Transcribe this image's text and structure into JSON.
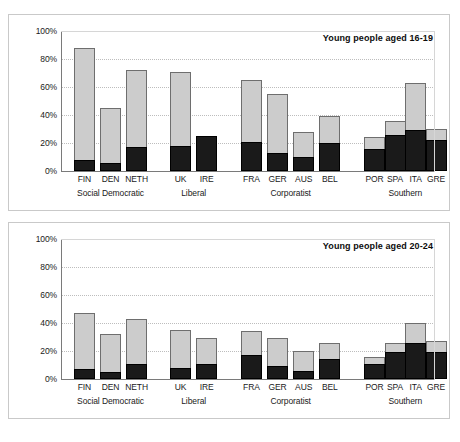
{
  "figure": {
    "panels": [
      {
        "id": "top",
        "title": "Young people aged 16-19"
      },
      {
        "id": "bottom",
        "title": "Young people aged 20-24"
      }
    ]
  },
  "axis": {
    "yticks": [
      "100%",
      "80%",
      "60%",
      "40%",
      "20%",
      "0%"
    ],
    "ytick_values": [
      100,
      80,
      60,
      40,
      20,
      0
    ],
    "ylim": [
      0,
      100
    ]
  },
  "groups": [
    {
      "label": "Social Democratic",
      "countries": [
        "FIN",
        "DEN",
        "NETH"
      ]
    },
    {
      "label": "Liberal",
      "countries": [
        "UK",
        "IRE"
      ]
    },
    {
      "label": "Corporatist",
      "countries": [
        "FRA",
        "GER",
        "AUS",
        "BEL"
      ]
    },
    {
      "label": "Southern",
      "countries": [
        "POR",
        "SPA",
        "ITA",
        "GRE"
      ]
    }
  ],
  "colors": {
    "total_fill": "#cccccc",
    "total_edge": "#6e6e6e",
    "sub_fill": "#1a1a1a",
    "sub_edge": "#000000",
    "axis": "#7a7a7a",
    "grid": "#bdbdbd",
    "panel_border": "#c9c9c9",
    "text": "#1a1a1a"
  },
  "chart_data": [
    {
      "type": "bar",
      "title": "Young people aged 16-19",
      "xlabel": "",
      "ylabel": "",
      "ylim": [
        0,
        100
      ],
      "grid": true,
      "legend": "none",
      "categories": [
        "FIN",
        "DEN",
        "NETH",
        "UK",
        "IRE",
        "FRA",
        "GER",
        "AUS",
        "BEL",
        "POR",
        "SPA",
        "ITA",
        "GRE"
      ],
      "group_of_category": [
        "Social Democratic",
        "Social Democratic",
        "Social Democratic",
        "Liberal",
        "Liberal",
        "Corporatist",
        "Corporatist",
        "Corporatist",
        "Corporatist",
        "Southern",
        "Southern",
        "Southern",
        "Southern"
      ],
      "series": [
        {
          "name": "total (grey)",
          "values": [
            88,
            45,
            72,
            71,
            25,
            65,
            55,
            28,
            39,
            24,
            36,
            63,
            30
          ]
        },
        {
          "name": "sub (black)",
          "values": [
            8,
            6,
            17,
            18,
            25,
            21,
            13,
            10,
            20,
            16,
            26,
            29,
            22
          ]
        }
      ]
    },
    {
      "type": "bar",
      "title": "Young people aged 20-24",
      "xlabel": "",
      "ylabel": "",
      "ylim": [
        0,
        100
      ],
      "grid": true,
      "legend": "none",
      "categories": [
        "FIN",
        "DEN",
        "NETH",
        "UK",
        "IRE",
        "FRA",
        "GER",
        "AUS",
        "BEL",
        "POR",
        "SPA",
        "ITA",
        "GRE"
      ],
      "group_of_category": [
        "Social Democratic",
        "Social Democratic",
        "Social Democratic",
        "Liberal",
        "Liberal",
        "Corporatist",
        "Corporatist",
        "Corporatist",
        "Corporatist",
        "Southern",
        "Southern",
        "Southern",
        "Southern"
      ],
      "series": [
        {
          "name": "total (grey)",
          "values": [
            47,
            32,
            43,
            35,
            29,
            34,
            29,
            20,
            26,
            16,
            26,
            40,
            27
          ]
        },
        {
          "name": "sub (black)",
          "values": [
            7,
            5,
            11,
            8,
            11,
            17,
            9,
            6,
            14,
            11,
            19,
            26,
            19
          ]
        }
      ]
    }
  ]
}
